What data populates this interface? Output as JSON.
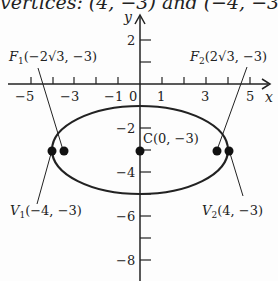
{
  "header_fragment": "vertices: (4, −3) and (−4, −3)",
  "colors": {
    "ink": "#222222",
    "background": "#fdfdfd"
  },
  "axes": {
    "x_label": "x",
    "y_label": "y",
    "x_ticks": [
      {
        "value": -5,
        "label": "−5"
      },
      {
        "value": -3,
        "label": "−3"
      },
      {
        "value": -1,
        "label": "−1"
      },
      {
        "value": 0,
        "label": "0"
      },
      {
        "value": 1,
        "label": "1"
      },
      {
        "value": 3,
        "label": "3"
      },
      {
        "value": 5,
        "label": "5"
      }
    ],
    "y_ticks": [
      {
        "value": 2,
        "label": "2"
      },
      {
        "value": -2,
        "label": "−2"
      },
      {
        "value": -4,
        "label": "−4"
      },
      {
        "value": -6,
        "label": "−6"
      },
      {
        "value": -8,
        "label": "−8"
      }
    ]
  },
  "ellipse": {
    "center": [
      0,
      -3
    ],
    "a": 4,
    "b": 2
  },
  "points": {
    "center": {
      "label": "C(0, −3)",
      "coords": [
        0,
        -3
      ]
    },
    "f1": {
      "name": "F",
      "sub": "1",
      "label_rest": "(−2√3, −3)",
      "coords": [
        -3.464,
        -3
      ]
    },
    "f2": {
      "name": "F",
      "sub": "2",
      "label_rest": "(2√3, −3)",
      "coords": [
        3.464,
        -3
      ]
    },
    "v1": {
      "name": "V",
      "sub": "1",
      "label_rest": "(−4, −3)",
      "coords": [
        -4,
        -3
      ]
    },
    "v2": {
      "name": "V",
      "sub": "2",
      "label_rest": "(4, −3)",
      "coords": [
        4,
        -3
      ]
    }
  }
}
